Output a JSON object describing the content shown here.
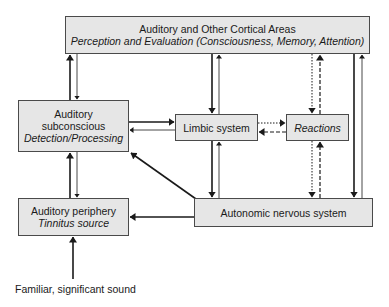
{
  "diagram": {
    "nodes": {
      "cortex": {
        "title": "Auditory and Other Cortical Areas",
        "subtitle": "Perception and Evaluation (Consciousness, Memory, Attention)"
      },
      "subconscious": {
        "line1": "Auditory",
        "line2": "subconscious",
        "subtitle": "Detection/Processing"
      },
      "limbic": {
        "title": "Limbic system"
      },
      "reactions": {
        "subtitle": "Reactions"
      },
      "periphery": {
        "title": "Auditory periphery",
        "subtitle": "Tinnitus source"
      },
      "autonomic": {
        "title": "Autonomic nervous system"
      }
    },
    "input_label": "Familiar, significant sound",
    "edges": [
      {
        "from": "subconscious",
        "to": "cortex",
        "style": "solid"
      },
      {
        "from": "cortex",
        "to": "subconscious",
        "style": "solid"
      },
      {
        "from": "subconscious",
        "to": "limbic",
        "style": "solid"
      },
      {
        "from": "limbic",
        "to": "subconscious",
        "style": "solid"
      },
      {
        "from": "cortex",
        "to": "limbic",
        "style": "solid"
      },
      {
        "from": "limbic",
        "to": "cortex",
        "style": "solid"
      },
      {
        "from": "limbic",
        "to": "reactions",
        "style": "dotted"
      },
      {
        "from": "reactions",
        "to": "limbic",
        "style": "dashed"
      },
      {
        "from": "cortex",
        "to": "reactions",
        "style": "dotted"
      },
      {
        "from": "reactions",
        "to": "cortex",
        "style": "dashed"
      },
      {
        "from": "reactions",
        "to": "autonomic",
        "style": "dotted"
      },
      {
        "from": "autonomic",
        "to": "reactions",
        "style": "dashed"
      },
      {
        "from": "cortex",
        "to": "autonomic",
        "style": "solid"
      },
      {
        "from": "autonomic",
        "to": "cortex",
        "style": "solid"
      },
      {
        "from": "limbic",
        "to": "autonomic",
        "style": "solid"
      },
      {
        "from": "autonomic",
        "to": "limbic",
        "style": "solid"
      },
      {
        "from": "autonomic",
        "to": "subconscious",
        "style": "solid"
      },
      {
        "from": "autonomic",
        "to": "periphery",
        "style": "solid"
      },
      {
        "from": "periphery",
        "to": "subconscious",
        "style": "solid"
      },
      {
        "from": "subconscious",
        "to": "periphery",
        "style": "solid"
      },
      {
        "from": "input",
        "to": "periphery",
        "style": "solid"
      }
    ]
  }
}
